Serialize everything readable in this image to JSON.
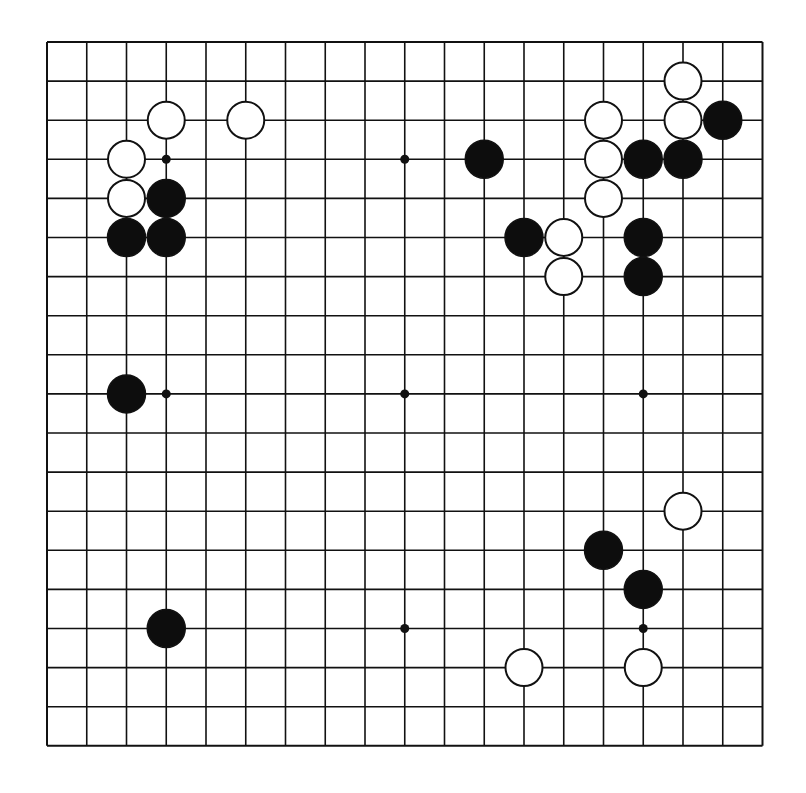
{
  "board": {
    "size": 19,
    "origin_x": 47,
    "origin_y": 42,
    "spacing_x": 39.75,
    "spacing_y": 39.1,
    "line_color": "#111111",
    "background": "#ffffff",
    "stone_radius": 19,
    "star_radius": 4.5,
    "star_points": [
      [
        3,
        3
      ],
      [
        9,
        3
      ],
      [
        15,
        3
      ],
      [
        3,
        9
      ],
      [
        9,
        9
      ],
      [
        15,
        9
      ],
      [
        3,
        15
      ],
      [
        9,
        15
      ],
      [
        15,
        15
      ]
    ],
    "hidden_star_points": [
      [
        3,
        3
      ],
      [
        15,
        3
      ]
    ]
  },
  "stones": {
    "black": [
      [
        3,
        4
      ],
      [
        2,
        5
      ],
      [
        3,
        5
      ],
      [
        11,
        3
      ],
      [
        12,
        5
      ],
      [
        15,
        3
      ],
      [
        16,
        3
      ],
      [
        17,
        2
      ],
      [
        15,
        5
      ],
      [
        15,
        6
      ],
      [
        2,
        9
      ],
      [
        14,
        13
      ],
      [
        15,
        14
      ],
      [
        3,
        15
      ]
    ],
    "white": [
      [
        3,
        2
      ],
      [
        5,
        2
      ],
      [
        2,
        3
      ],
      [
        2,
        4
      ],
      [
        13,
        5
      ],
      [
        13,
        6
      ],
      [
        14,
        2
      ],
      [
        14,
        3
      ],
      [
        14,
        4
      ],
      [
        16,
        1
      ],
      [
        16,
        2
      ],
      [
        16,
        12
      ],
      [
        12,
        16
      ],
      [
        15,
        16
      ]
    ]
  },
  "colors": {
    "black_stone": "#0d0d0d",
    "white_stone": "#ffffff",
    "stone_outline": "#111111"
  }
}
